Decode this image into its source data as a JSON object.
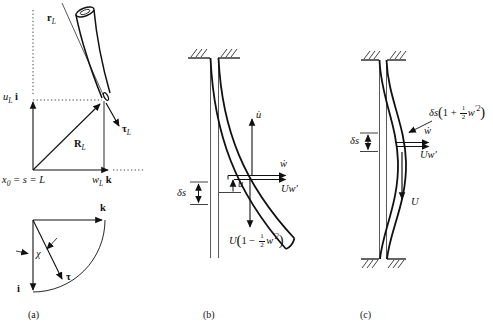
{
  "captions": {
    "a": "(a)",
    "b": "(b)",
    "c": "(c)"
  },
  "panel_a": {
    "r_vec": {
      "main": "r",
      "sub": "L"
    },
    "u_axis": {
      "var": "u",
      "sub": "L",
      "unit": "i"
    },
    "tau_vec": {
      "main": "τ",
      "sub": "L"
    },
    "R_vec": {
      "main": "R",
      "sub": "L"
    },
    "x_eq": {
      "var": "x",
      "sub": "0",
      "rest": " = s = L"
    },
    "w_axis": {
      "var": "w",
      "sub": "L",
      "unit": "k"
    },
    "k_unit": "k",
    "i_unit": "i",
    "tau_unit": "τ",
    "chi": "χ"
  },
  "panel_b": {
    "u_dot": "u̇",
    "w_dot": "ẇ",
    "Uw_prime": "Uw′",
    "u_disp": "u",
    "delta_s": "δs",
    "formula": {
      "pre": "U",
      "open": "(",
      "body": "1 − ",
      "num": "1",
      "den": "2",
      "post": "w",
      "sup": "′2",
      "close": ")"
    }
  },
  "panel_c": {
    "formula": {
      "pre": "δs",
      "open": "(",
      "body": "1 + ",
      "num": "1",
      "den": "2",
      "post": "w",
      "sup": "′2",
      "close": ")"
    },
    "delta_s": "δs",
    "w_dot": "ẇ",
    "Uw_prime": "Uw′",
    "U_vel": "U"
  },
  "colors": {
    "ink": "#111111"
  }
}
